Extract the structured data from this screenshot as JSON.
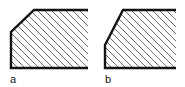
{
  "figures": [
    {
      "label": "a",
      "description": "chamfered corner, 45-degree bevel",
      "outline": [
        [
          88,
          10
        ],
        [
          34,
          10
        ],
        [
          11,
          32
        ],
        [
          11,
          68
        ],
        [
          88,
          68
        ]
      ],
      "clip": [
        [
          88,
          10
        ],
        [
          34,
          10
        ],
        [
          11,
          32
        ],
        [
          11,
          68
        ],
        [
          88,
          68
        ]
      ],
      "label_pos": [
        10,
        74
      ]
    },
    {
      "label": "b",
      "description": "chamfered corner, steep bevel",
      "outline": [
        [
          176,
          10
        ],
        [
          123,
          10
        ],
        [
          105,
          45
        ],
        [
          105,
          68
        ],
        [
          176,
          68
        ]
      ],
      "clip": [
        [
          176,
          10
        ],
        [
          123,
          10
        ],
        [
          105,
          45
        ],
        [
          105,
          68
        ],
        [
          176,
          68
        ]
      ],
      "label_pos": [
        105,
        74
      ]
    }
  ],
  "style": {
    "outline_color": "#111111",
    "hatch_color": "#555555",
    "hatch_spacing": 7
  }
}
